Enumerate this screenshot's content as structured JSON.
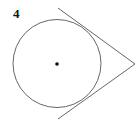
{
  "diagram": {
    "problem_number": "4",
    "circle": {
      "cx": 57,
      "cy": 63.5,
      "r": 44
    },
    "center_point": {
      "x": 57,
      "y": 64,
      "r": 1.8
    },
    "external_point": {
      "x": 135,
      "y": 64
    },
    "tangent_lines": [
      {
        "name": "upper-tangent",
        "x1": 58,
        "y1": 8,
        "x2": 135,
        "y2": 64
      },
      {
        "name": "lower-tangent",
        "x1": 58,
        "y1": 119,
        "x2": 135,
        "y2": 64
      }
    ],
    "colors": {
      "stroke": "#555555",
      "dot": "#111111",
      "background": "#ffffff"
    }
  }
}
